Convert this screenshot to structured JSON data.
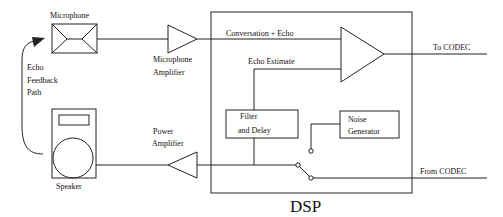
{
  "diagram": {
    "title": "DSP",
    "components": {
      "microphone": "Microphone",
      "microphone_amplifier_line1": "Microphone",
      "microphone_amplifier_line2": "Amplifier",
      "speaker": "Speaker",
      "power_amplifier_line1": "Power",
      "power_amplifier_line2": "Amplifier",
      "filter_delay_line1": "Filter",
      "filter_delay_line2": "and Delay",
      "noise_generator_line1": "Noise",
      "noise_generator_line2": "Generator"
    },
    "signals": {
      "conversation_echo": "Conversation + Echo",
      "echo_estimate": "Echo Estimate",
      "to_codec": "To CODEC",
      "from_codec": "From CODEC"
    },
    "feedback": {
      "line1": "Echo",
      "line2": "Feedback",
      "line3": "Path"
    },
    "stroke_color": "#222222"
  }
}
